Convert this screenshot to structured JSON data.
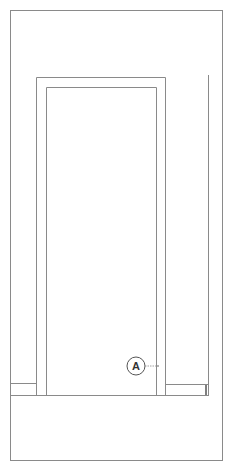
{
  "drawing": {
    "subject": "door elevation line drawing",
    "line_color": "#8a8a8a",
    "dark_line_color": "#555555",
    "background": "#ffffff",
    "callout": {
      "label": "A",
      "cx": 136,
      "cy": 366,
      "r": 9,
      "leader_to_x": 158
    }
  }
}
